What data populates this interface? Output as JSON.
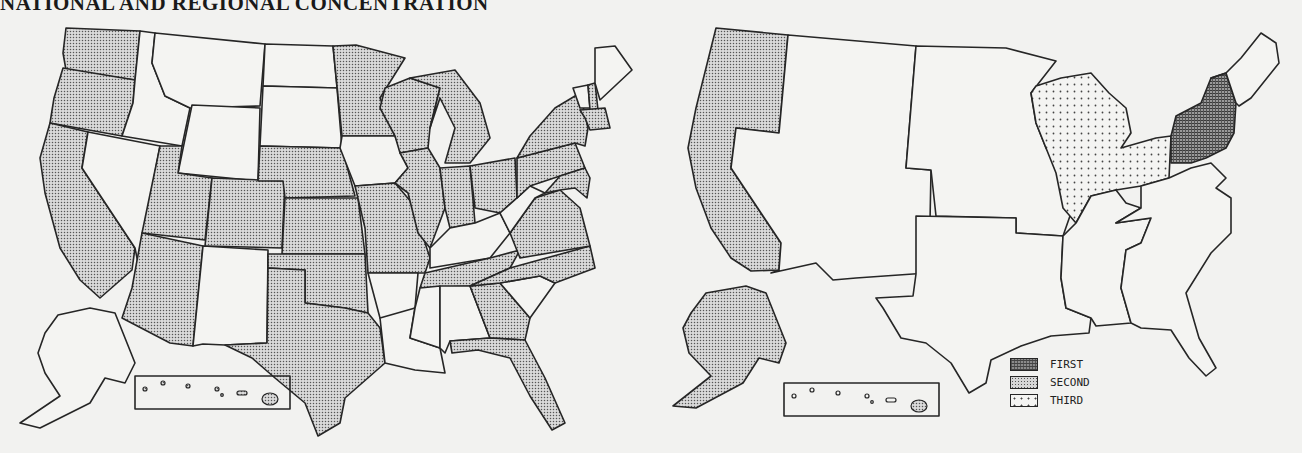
{
  "title": "NATIONAL AND REGIONAL CONCENTRATION",
  "legend": {
    "items": [
      {
        "key": "first",
        "label": "FIRST"
      },
      {
        "key": "second",
        "label": "SECOND"
      },
      {
        "key": "third",
        "label": "THIRD"
      }
    ]
  },
  "colors": {
    "outline": "#262626",
    "background": "#f2f2f0",
    "shaded_fill": "#d6d6d6",
    "first_fill": "#8a8a8a",
    "third_fill": "#f4f4f2"
  },
  "left_map": {
    "description": "States of concentration (shaded) vs. not shaded",
    "shaded_states": [
      "WA",
      "OR",
      "CA",
      "UT",
      "CO",
      "AZ",
      "NE",
      "KS",
      "OK",
      "TX",
      "MN",
      "WI",
      "MI",
      "IL",
      "IN",
      "OH",
      "MO",
      "TN",
      "GA",
      "FL",
      "VA",
      "NC",
      "PA",
      "NY",
      "NJ",
      "MD",
      "DE",
      "CT",
      "MA",
      "RI",
      "NH"
    ],
    "unshaded_states": [
      "ID",
      "MT",
      "WY",
      "NV",
      "NM",
      "ND",
      "SD",
      "IA",
      "AR",
      "LA",
      "MS",
      "AL",
      "KY",
      "WV",
      "SC",
      "ME",
      "VT",
      "AK",
      "HI"
    ]
  },
  "right_map": {
    "description": "Regional concentration ranking",
    "regions": [
      {
        "name": "Middle Atlantic",
        "states": [
          "NY",
          "PA",
          "NJ"
        ],
        "rank": "FIRST"
      },
      {
        "name": "Pacific",
        "states": [
          "WA",
          "OR",
          "CA",
          "AK",
          "HI"
        ],
        "rank": "SECOND"
      },
      {
        "name": "East North Central",
        "states": [
          "WI",
          "MI",
          "IL",
          "IN",
          "OH"
        ],
        "rank": "THIRD"
      },
      {
        "name": "Mountain",
        "states": [
          "MT",
          "ID",
          "WY",
          "NV",
          "UT",
          "CO",
          "AZ",
          "NM"
        ],
        "rank": "none"
      },
      {
        "name": "West North Central",
        "states": [
          "ND",
          "SD",
          "NE",
          "KS",
          "MN",
          "IA",
          "MO"
        ],
        "rank": "none"
      },
      {
        "name": "West South Central",
        "states": [
          "TX",
          "OK",
          "AR",
          "LA"
        ],
        "rank": "none"
      },
      {
        "name": "East South Central",
        "states": [
          "KY",
          "TN",
          "MS",
          "AL"
        ],
        "rank": "none"
      },
      {
        "name": "South Atlantic",
        "states": [
          "WV",
          "VA",
          "NC",
          "SC",
          "GA",
          "FL",
          "MD",
          "DE"
        ],
        "rank": "none"
      },
      {
        "name": "New England",
        "states": [
          "ME",
          "VT",
          "NH",
          "MA",
          "CT",
          "RI"
        ],
        "rank": "none"
      }
    ]
  }
}
